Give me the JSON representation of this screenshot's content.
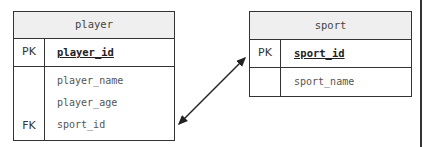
{
  "diagram": {
    "type": "entity-relationship",
    "tables": [
      {
        "name": "player",
        "primary_key": {
          "label": "PK",
          "field": "player_id"
        },
        "fields": [
          "player_name",
          "player_age",
          "sport_id"
        ],
        "foreign_key": {
          "label": "FK",
          "field": "sport_id"
        }
      },
      {
        "name": "sport",
        "primary_key": {
          "label": "PK",
          "field": "sport_id"
        },
        "fields": [
          "sport_name"
        ]
      }
    ],
    "relationship": {
      "from": "player.sport_id",
      "to": "sport.sport_id",
      "style": "double-headed-arrow"
    }
  },
  "colors": {
    "border": "#333333",
    "header_bg": "#efefef",
    "background": "#ffffff"
  }
}
